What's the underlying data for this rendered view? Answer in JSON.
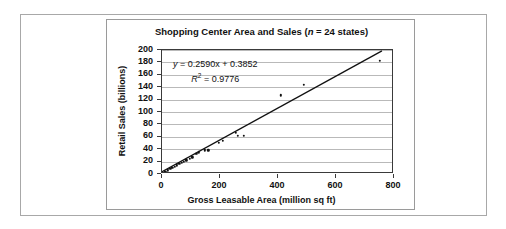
{
  "figure": {
    "background_color": "#ffffff",
    "frame_color": "#a8a8a8",
    "panel_border_color": "#9a9a9a"
  },
  "chart_data": {
    "type": "scatter",
    "title": "Shopping Center Area and Sales (n = 24 states)",
    "title_prefix": "Shopping Center Area and Sales (",
    "title_italic": "n",
    "title_suffix": " = 24 states)",
    "xlabel": "Gross Leasable Area (million sq ft)",
    "ylabel": "Retail Sales (billions)",
    "xlim": [
      0,
      800
    ],
    "ylim": [
      0,
      200
    ],
    "xticks": [
      0,
      200,
      400,
      600,
      800
    ],
    "yticks": [
      0,
      20,
      40,
      60,
      80,
      100,
      120,
      140,
      160,
      180,
      200
    ],
    "grid": "horizontal",
    "legend": "none",
    "n_points": 24,
    "marker_color": "#111111",
    "trendline_color": "#111111",
    "annotation": {
      "equation": "y = 0.2590x + 0.3852",
      "equation_lhs": "y",
      "equation_rhs": " = 0.2590x + 0.3852",
      "r_squared_label": "R",
      "r_squared_exp": "2",
      "r_squared_value": " = 0.9776",
      "slope": 0.259,
      "intercept": 0.3852,
      "r_squared": 0.9776
    },
    "trendline": {
      "x_start": 0,
      "y_start": 0.3852,
      "x_end": 765,
      "y_end": 198.5
    },
    "points": [
      {
        "x": 12,
        "y": 4
      },
      {
        "x": 20,
        "y": 6
      },
      {
        "x": 28,
        "y": 8
      },
      {
        "x": 36,
        "y": 10
      },
      {
        "x": 44,
        "y": 12
      },
      {
        "x": 52,
        "y": 14
      },
      {
        "x": 60,
        "y": 16
      },
      {
        "x": 68,
        "y": 18
      },
      {
        "x": 76,
        "y": 20
      },
      {
        "x": 84,
        "y": 22
      },
      {
        "x": 95,
        "y": 25
      },
      {
        "x": 104,
        "y": 27
      },
      {
        "x": 118,
        "y": 33
      },
      {
        "x": 126,
        "y": 35
      },
      {
        "x": 148,
        "y": 38
      },
      {
        "x": 160,
        "y": 38
      },
      {
        "x": 196,
        "y": 50
      },
      {
        "x": 210,
        "y": 54
      },
      {
        "x": 255,
        "y": 66
      },
      {
        "x": 262,
        "y": 62
      },
      {
        "x": 282,
        "y": 62
      },
      {
        "x": 410,
        "y": 127
      },
      {
        "x": 490,
        "y": 144
      },
      {
        "x": 752,
        "y": 183
      }
    ]
  }
}
